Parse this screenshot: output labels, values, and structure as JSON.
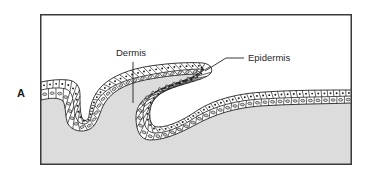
{
  "figure": {
    "panel_label": "A",
    "callouts": {
      "dermis": "Dermis",
      "epidermis": "Epidermis"
    }
  },
  "colors": {
    "frame_stroke": "#3a3a3a",
    "dermis_fill": "#dcdcdc",
    "background": "#ffffff",
    "cell_stroke": "#222222",
    "cell_fill": "#ffffff",
    "outer_nucleus": "#1a1a1a",
    "inner_nucleus_fill": "#d0d0d0",
    "leader_line": "#222222"
  }
}
